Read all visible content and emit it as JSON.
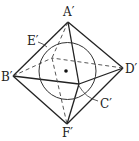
{
  "diagram": {
    "title": "",
    "vertices": {
      "A": {
        "label": "A′",
        "x": 68,
        "y": 22
      },
      "B": {
        "label": "B′",
        "x": 13,
        "y": 76
      },
      "C": {
        "label": "C′",
        "x": 79,
        "y": 84
      },
      "D": {
        "label": "D′",
        "x": 123,
        "y": 68
      },
      "E": {
        "label": "E′",
        "x": 52,
        "y": 58
      },
      "F": {
        "label": "F′",
        "x": 67,
        "y": 124
      }
    },
    "labels": {
      "A": "A′",
      "B": "B′",
      "C": "C′",
      "D": "D′",
      "E": "E′",
      "F": "F′"
    },
    "inscribed_circle": {
      "cx": 67.5,
      "cy": 71,
      "r": 28.5
    },
    "center_point": {
      "x": 66,
      "y": 71
    },
    "colors": {
      "stroke": "#222222",
      "background": "#ffffff"
    }
  }
}
